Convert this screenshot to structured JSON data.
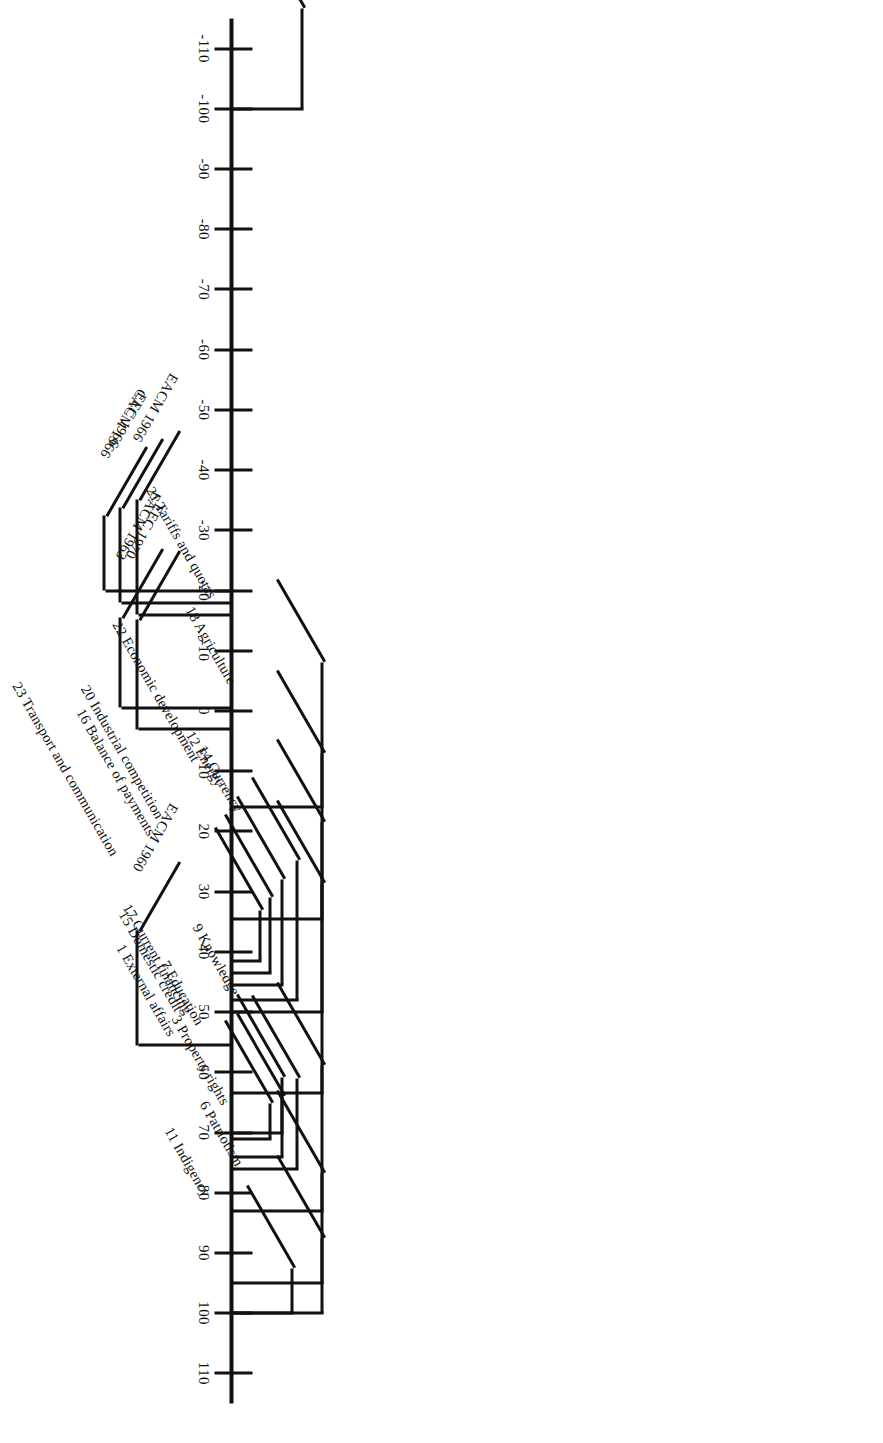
{
  "figure": {
    "orientation": "rotated-90",
    "axis": {
      "min": -115,
      "max": 115,
      "tick_step": 10,
      "tick_labels": [
        "110",
        "100",
        "90",
        "80",
        "70",
        "60",
        "50",
        "40",
        "30",
        "20",
        "10",
        "0",
        "-10",
        "-20",
        "-30",
        "-40",
        "-50",
        "-60",
        "-70",
        "-80",
        "-90",
        "-100",
        "-110"
      ],
      "tick_values": [
        110,
        100,
        90,
        80,
        70,
        60,
        50,
        40,
        30,
        20,
        10,
        0,
        -10,
        -20,
        -30,
        -40,
        -50,
        -60,
        -70,
        -80,
        -90,
        -100,
        -110
      ]
    },
    "colors": {
      "ink": "#111111",
      "paper": "#ffffff"
    }
  },
  "chart_data": {
    "type": "scatter",
    "title": "",
    "xlabel": "",
    "ylabel": "",
    "ylim": [
      -115,
      115
    ],
    "grid": false,
    "legend": "none",
    "axis_tick_labels": [
      "110",
      "100",
      "90",
      "80",
      "70",
      "60",
      "50",
      "40",
      "30",
      "20",
      "10",
      "0",
      "-10",
      "-20",
      "-30",
      "-40",
      "-50",
      "-60",
      "-70",
      "-80",
      "-90",
      "-100",
      "-110"
    ],
    "categories": [
      "6 Patriotism",
      "11 Indigency",
      "3 Property rights",
      "9 Knowledge",
      "17 Current financing",
      "7 Education",
      "1 External affairs",
      "15 Domestic credit",
      "14 Currency",
      "22 Economic development",
      "12 Energy",
      "20 Industrial competition",
      "16 Balance of payments",
      "23 Transport and communication",
      "18 Agriculture",
      "21 Tariffs and quotas",
      "24 Resources",
      "EACM 1960",
      "EEC 1970",
      "EACM 1963",
      "EACM 1966",
      "EEC 1966",
      "CACM 1966"
    ],
    "values": [
      100,
      100,
      95,
      83,
      76,
      74,
      71,
      70,
      63.5,
      50,
      48,
      45.5,
      43.5,
      41.5,
      34.5,
      16,
      -100,
      55.5,
      3,
      -0.5,
      -16,
      -18,
      -20
    ]
  },
  "left_items": [
    {
      "label": "6 Patriotism",
      "value": 100
    },
    {
      "label": "11 Indigency",
      "value": 100
    },
    {
      "label": "3 Property rights",
      "value": 95
    },
    {
      "label": "9 Knowledge",
      "value": 83
    },
    {
      "label": "17 Current financing",
      "value": 76
    },
    {
      "label": "7 Education",
      "value": 74
    },
    {
      "label": "1 External affairs",
      "value": 71
    },
    {
      "label": "15 Domestic credit",
      "value": 70
    },
    {
      "label": "14 Currency",
      "value": 63.5
    },
    {
      "label": "22 Economic development",
      "value": 50
    },
    {
      "label": "12 Energy",
      "value": 48
    },
    {
      "label": "20 Industrial competition",
      "value": 45.5
    },
    {
      "label": "16 Balance of payments",
      "value": 43.5
    },
    {
      "label": "23 Transport and communication",
      "value": 41.5
    },
    {
      "label": "18 Agriculture",
      "value": 34.5
    },
    {
      "label": "21 Tariffs and quotas",
      "value": 16
    },
    {
      "label": "24 Resources",
      "value": -100
    }
  ],
  "right_items": [
    {
      "label": "EACM 1960",
      "value": 55.5
    },
    {
      "label": "EEC 1970",
      "value": 3
    },
    {
      "label": "EACM 1963",
      "value": -0.5
    },
    {
      "label": "EACM 1966",
      "value": -16
    },
    {
      "label": "EEC 1966",
      "value": -18
    },
    {
      "label": "CACM 1966",
      "value": -20
    }
  ]
}
